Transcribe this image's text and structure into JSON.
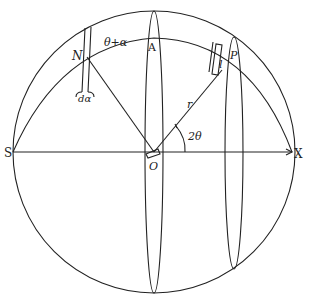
{
  "diagram": {
    "type": "sphere-geometry",
    "stroke_color": "#222222",
    "background": "#ffffff",
    "labels": {
      "S": "S",
      "X": "X",
      "O": "O",
      "A": "A",
      "N": "N",
      "P": "P",
      "l": "l",
      "r": "r",
      "two_theta": "2θ",
      "theta_plus_alpha": "θ+α",
      "d_alpha": "dα"
    },
    "elements": [
      {
        "name": "outer-sphere-circle",
        "desc": "outer circle of sphere"
      },
      {
        "name": "equator-axis",
        "desc": "horizontal axis from S through O to X with arrow"
      },
      {
        "name": "central-meridian-ellipse",
        "desc": "narrow ellipse through A and O"
      },
      {
        "name": "small-circle-ellipse",
        "desc": "narrow ellipse through P at angle 2θ"
      },
      {
        "name": "great-circle-arc",
        "desc": "arc from S through N, A, P to X"
      },
      {
        "name": "radius-line-to-N",
        "desc": "line from O to N"
      },
      {
        "name": "radius-line-r",
        "desc": "line from O to P, labeled r"
      },
      {
        "name": "d-alpha-strip",
        "desc": "thin strip at N of width dα"
      },
      {
        "name": "element-l",
        "desc": "small element of length l at P"
      }
    ]
  }
}
